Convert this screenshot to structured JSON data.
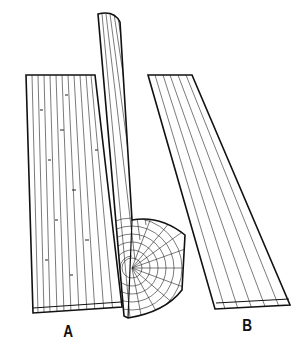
{
  "figure": {
    "labels": {
      "board_a": "A",
      "board_b": "B"
    },
    "colors": {
      "ink": "#111111",
      "background": "#ffffff"
    }
  }
}
